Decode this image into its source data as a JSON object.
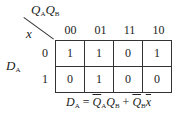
{
  "kmap": {
    "column_variables": "QAQB",
    "row_variable": "x",
    "output_label": "DA",
    "column_headers": [
      "00",
      "01",
      "11",
      "10"
    ],
    "row_headers": [
      "0",
      "1"
    ],
    "cells": [
      [
        "1",
        "1",
        "0",
        "1"
      ],
      [
        "0",
        "1",
        "0",
        "0"
      ]
    ]
  },
  "equation": {
    "lhs": "DA",
    "rhs": "Q̄A QB + Q̄B x̄",
    "text": "DA = Q̄AQB + Q̄Bx̄"
  }
}
